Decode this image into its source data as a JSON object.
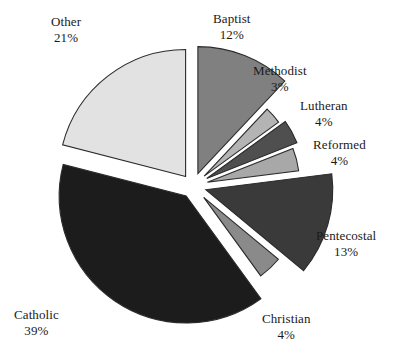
{
  "chart_data": {
    "type": "pie",
    "title": "",
    "subtitle": "",
    "xlabel": "",
    "ylabel": "",
    "legend_position": "none",
    "grid": false,
    "exploded": true,
    "value_unit": "%",
    "categories": [
      "Baptist",
      "Methodist",
      "Lutheran",
      "Reformed",
      "Pentecostal",
      "Christian",
      "Catholic",
      "Other"
    ],
    "values": [
      12,
      3,
      4,
      4,
      13,
      4,
      39,
      21
    ],
    "slices": [
      {
        "label": "Baptist",
        "percent": 12,
        "percent_text": "12%",
        "color": "#808080",
        "start_angle": 0,
        "end_angle": 43.2,
        "explode": 0.055,
        "radius": 127,
        "label_x": 213,
        "label_y": 11
      },
      {
        "label": "Methodist",
        "percent": 3,
        "percent_text": "3%",
        "color": "#b4b4b4",
        "start_angle": 43.2,
        "end_angle": 54.0,
        "explode": 0.085,
        "radius": 92,
        "label_x": 253,
        "label_y": 63
      },
      {
        "label": "Lutheran",
        "percent": 4,
        "percent_text": "4%",
        "color": "#4f4f4f",
        "start_angle": 54.0,
        "end_angle": 68.4,
        "explode": 0.085,
        "radius": 97,
        "label_x": 300,
        "label_y": 98
      },
      {
        "label": "Reformed",
        "percent": 4,
        "percent_text": "4%",
        "color": "#a8a8a8",
        "start_angle": 68.4,
        "end_angle": 82.8,
        "explode": 0.085,
        "radius": 92,
        "label_x": 313,
        "label_y": 137
      },
      {
        "label": "Pentecostal",
        "percent": 13,
        "percent_text": "13%",
        "color": "#3a3a3a",
        "start_angle": 82.8,
        "end_angle": 129.6,
        "explode": 0.055,
        "radius": 127,
        "label_x": 316,
        "label_y": 228
      },
      {
        "label": "Christian",
        "percent": 4,
        "percent_text": "4%",
        "color": "#8a8a8a",
        "start_angle": 129.6,
        "end_angle": 144.0,
        "explode": 0.085,
        "radius": 97,
        "label_x": 262,
        "label_y": 311
      },
      {
        "label": "Catholic",
        "percent": 39,
        "percent_text": "39%",
        "color": "#1c1c1c",
        "start_angle": 144.0,
        "end_angle": 284.4,
        "explode": 0.05,
        "radius": 127,
        "label_x": 14,
        "label_y": 307
      },
      {
        "label": "Other",
        "percent": 21,
        "percent_text": "21%",
        "color": "#e2e2e2",
        "start_angle": 284.4,
        "end_angle": 360.0,
        "explode": 0.05,
        "radius": 127,
        "label_x": 51,
        "label_y": 14
      }
    ],
    "center": {
      "x": 193,
      "y": 186
    }
  }
}
